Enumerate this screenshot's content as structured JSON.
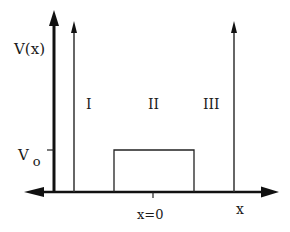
{
  "diagram": {
    "type": "potential-barrier",
    "y_axis_label": "V(x)",
    "x_axis_label": "x",
    "barrier_height_label_main": "V",
    "barrier_height_label_sub": "o",
    "origin_label": "x=0",
    "regions": [
      {
        "id": "I",
        "label": "I"
      },
      {
        "id": "II",
        "label": "II"
      },
      {
        "id": "III",
        "label": "III"
      }
    ],
    "colors": {
      "axis": "#111111",
      "lines": "#333333",
      "background": "#ffffff"
    }
  }
}
